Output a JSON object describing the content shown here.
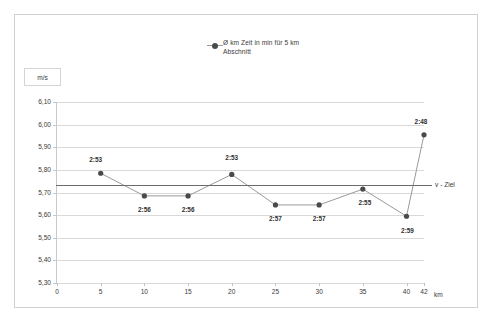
{
  "chart_data": {
    "type": "line",
    "title": "",
    "legend": [
      "Ø km Zeit in min für 5 km\nAbschnitt"
    ],
    "legend_position": "top-center",
    "grid": true,
    "xlabel": "km",
    "ylabel": "m/s",
    "x": [
      5,
      10,
      15,
      20,
      25,
      30,
      35,
      40,
      42
    ],
    "values": [
      5.785,
      5.685,
      5.685,
      5.78,
      5.645,
      5.645,
      5.715,
      5.595,
      5.955
    ],
    "point_labels": [
      "2:53",
      "2:56",
      "2:56",
      "2:53",
      "2:57",
      "2:57",
      "2:55",
      "2:59",
      "2:48"
    ],
    "xlim": [
      0,
      42
    ],
    "ylim": [
      5.3,
      6.1
    ],
    "xticks": [
      "0",
      "5",
      "10",
      "15",
      "20",
      "25",
      "30",
      "35",
      "40",
      "42"
    ],
    "xtick_values": [
      0,
      5,
      10,
      15,
      20,
      25,
      30,
      35,
      40,
      42
    ],
    "yticks": [
      "6,10",
      "6,00",
      "5,90",
      "5,80",
      "5,70",
      "5,60",
      "5,50",
      "5,40",
      "5,30"
    ],
    "ytick_values": [
      6.1,
      6.0,
      5.9,
      5.8,
      5.7,
      5.6,
      5.5,
      5.4,
      5.3
    ],
    "annotations": [
      {
        "label": "v - Ziel",
        "type": "horizontal-threshold-line",
        "value": 5.731
      }
    ],
    "series_color": "#4a4a4a",
    "line_color": "#9a9a9a",
    "threshold_color": "#6b6b6b",
    "grid_color": "#d9d9d9"
  }
}
